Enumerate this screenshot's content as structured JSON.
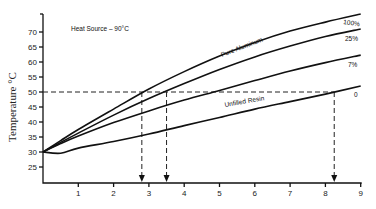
{
  "chart_data": {
    "type": "line",
    "title": "",
    "annotation": "Heat Source – 90°C",
    "xlabel": "",
    "ylabel": "Temperature °C",
    "xlim": [
      0,
      9
    ],
    "ylim": [
      20,
      75
    ],
    "x_ticks": [
      1,
      2,
      3,
      4,
      5,
      6,
      7,
      8,
      9
    ],
    "y_ticks": [
      25,
      30,
      35,
      40,
      45,
      50,
      55,
      60,
      65,
      70
    ],
    "grid": false,
    "legend": "inline labels at right end of curves",
    "x": [
      0,
      0.5,
      1,
      2,
      3,
      4,
      5,
      6,
      7,
      8,
      9
    ],
    "series": [
      {
        "name": "100%",
        "inline_label": "Pure Aluminum",
        "values": [
          30,
          33.8,
          37.5,
          44.3,
          51,
          56.8,
          62,
          66.5,
          70.3,
          73.3,
          76
        ]
      },
      {
        "name": "25%",
        "values": [
          30,
          33.2,
          36.3,
          42.3,
          47.8,
          52.8,
          57.5,
          61.7,
          65.3,
          68.5,
          71
        ]
      },
      {
        "name": "7%",
        "values": [
          30,
          32.8,
          35.3,
          39.8,
          43.7,
          47.3,
          50.5,
          53.8,
          57,
          59.8,
          62.3
        ]
      },
      {
        "name": "0",
        "inline_label": "Unfilled Resin",
        "values": [
          30,
          29.6,
          31.3,
          33.5,
          36,
          38.8,
          41.5,
          44.3,
          46.8,
          49.3,
          52
        ]
      }
    ],
    "reference_line": {
      "y": 50,
      "style": "dashed"
    },
    "drop_lines_x": [
      2.8,
      3.5,
      8.25
    ]
  },
  "labels": {
    "annotation": "Heat Source – 90°C",
    "ylabel": "Temperature °C",
    "curve_pure_aluminum": "Pure Aluminum",
    "curve_unfilled_resin": "Unfilled Resin",
    "end_100": "100%",
    "end_25": "25%",
    "end_7": "7%",
    "end_0": "0"
  }
}
